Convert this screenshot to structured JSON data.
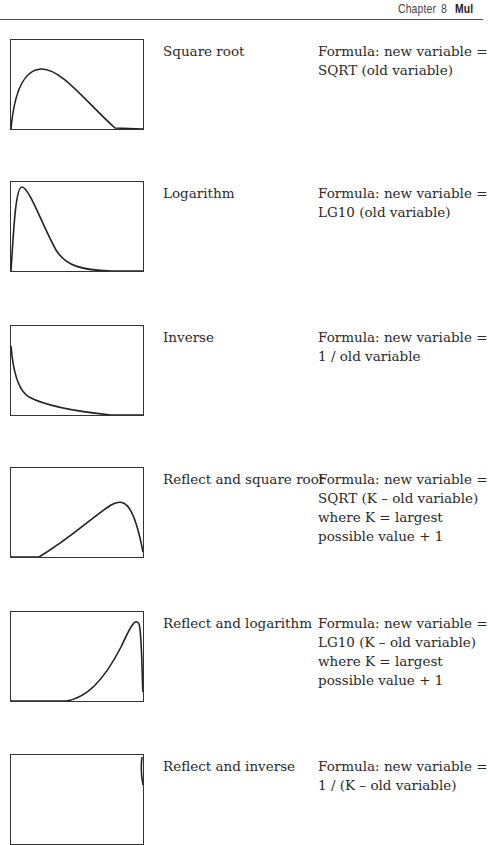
{
  "header": {
    "chapter_label": "Chapter",
    "chapter_number": "8",
    "part_title_fragment": "Mul"
  },
  "transformations": [
    {
      "name": "Square root",
      "formula_lines": [
        "Formula: new variable =",
        "SQRT (old variable)"
      ],
      "plot_icon": "positive-skew-moderate-curve",
      "curve_path": "M0,89 C3,55 12,30 30,29 C50,28 75,62 104,88 L132,89"
    },
    {
      "name": "Logarithm",
      "formula_lines": [
        "Formula: new variable =",
        "LG10 (old variable)"
      ],
      "plot_icon": "positive-skew-substantial-curve",
      "curve_path": "M0,89 C3,40 5,5 11,5 C18,5 32,45 45,68 C55,84 70,88 100,89 L132,89"
    },
    {
      "name": "Inverse",
      "formula_lines": [
        "Formula: new variable =",
        "1 / old variable"
      ],
      "plot_icon": "l-shaped-curve",
      "curve_path": "M0,20 C2,45 8,65 18,71 C35,80 70,86 100,89 L132,89"
    },
    {
      "name": "Reflect and square root",
      "formula_lines": [
        "Formula: new variable =",
        "SQRT (K – old variable)",
        "where K = largest",
        "possible value + 1"
      ],
      "plot_icon": "negative-skew-moderate-curve",
      "curve_path": "M0,89 L28,89 C60,70 80,50 100,37 C112,30 122,32 132,84"
    },
    {
      "name": "Reflect and logarithm",
      "formula_lines": [
        "Formula: new variable =",
        "LG10 (K – old variable)",
        "where K = largest",
        "possible value + 1"
      ],
      "plot_icon": "negative-skew-substantial-curve",
      "curve_path": "M0,89 L55,89 C75,86 92,70 110,35 C118,18 124,4 128,12 C131,20 131,70 132,80"
    },
    {
      "name": "Reflect and inverse",
      "formula_lines": [
        "Formula: new variable =",
        "1 / (K – old variable)"
      ],
      "plot_icon": "j-shaped-curve",
      "curve_path": "M132,30 C130,20 130,10 131,2"
    }
  ]
}
